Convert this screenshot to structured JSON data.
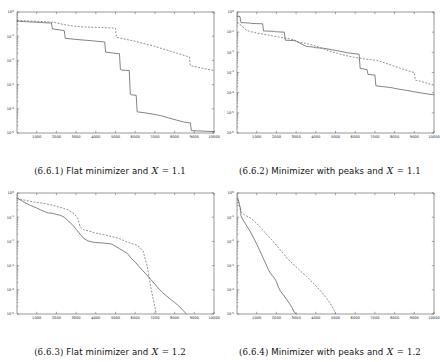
{
  "figure": {
    "panel_count": 4,
    "background_color": "#ffffff",
    "solid_series_color": "#5a5a5a",
    "dashed_series_color": "#6a6a6a",
    "axis_color": "#555555"
  },
  "panels": [
    {
      "id": "6.6.1",
      "caption_number": "(6.6.1)",
      "caption_text_before": "Flat minimizer and",
      "caption_variable": "X",
      "caption_equals": "= 1.1",
      "caption_full": "(6.6.1) Flat minimizer and X = 1.1"
    },
    {
      "id": "6.6.2",
      "caption_number": "(6.6.2)",
      "caption_text_before": "Minimizer with peaks and",
      "caption_variable": "X",
      "caption_equals": "= 1.1",
      "caption_full": "(6.6.2) Minimizer with peaks and X = 1.1"
    },
    {
      "id": "6.6.3",
      "caption_number": "(6.6.3)",
      "caption_text_before": "Flat minimizer and",
      "caption_variable": "X",
      "caption_equals": "= 1.2",
      "caption_full": "(6.6.3) Flat minimizer and X = 1.2"
    },
    {
      "id": "6.6.4",
      "caption_number": "(6.6.4)",
      "caption_text_before": "Minimizer with peaks and",
      "caption_variable": "X",
      "caption_equals": "= 1.2",
      "caption_full": "(6.6.4) Minimizer with peaks and X = 1.2"
    }
  ],
  "chart_data": [
    {
      "type": "line",
      "title": "(6.6.1) Flat minimizer and X = 1.1",
      "xlabel": "",
      "ylabel": "",
      "xlim": [
        0,
        10000
      ],
      "ylim": [
        1e-05,
        1
      ],
      "yscale": "log",
      "grid": false,
      "legend": null,
      "xticks": [
        1000,
        2000,
        3000,
        4000,
        5000,
        6000,
        7000,
        8000,
        9000,
        10000
      ],
      "xticklabels": [
        "1000",
        "2000",
        "3000",
        "4000",
        "5000",
        "6000",
        "7000",
        "8000",
        "9000",
        "10000"
      ],
      "yticks": [
        1,
        0.01,
        0.001,
        0.0001,
        1e-05
      ],
      "yticklabels": [
        "10^0",
        "10^-1",
        "10^-2",
        "10^-3",
        "10^-4",
        "10^-5"
      ],
      "series": [
        {
          "name": "solid",
          "style": "solid",
          "x": [
            0,
            400,
            900,
            1400,
            1750,
            1800,
            2200,
            2400,
            2450,
            2900,
            3300,
            3800,
            4200,
            4450,
            4500,
            4900,
            5200,
            5250,
            5300,
            5700,
            5750,
            5800,
            6050,
            6100,
            6500,
            6900,
            7300,
            7700,
            8100,
            8500,
            8800,
            8850,
            9200,
            9600,
            10000
          ],
          "y": [
            0.42,
            0.4,
            0.38,
            0.36,
            0.35,
            0.2,
            0.18,
            0.17,
            0.082,
            0.075,
            0.07,
            0.065,
            0.06,
            0.058,
            0.022,
            0.02,
            0.019,
            0.0042,
            0.004,
            0.0038,
            0.0004,
            0.00038,
            0.00036,
            7.5e-05,
            6.8e-05,
            6e-05,
            5.2e-05,
            4.2e-05,
            3.4e-05,
            2.8e-05,
            2.6e-05,
            1.25e-05,
            1.22e-05,
            1.18e-05,
            1.15e-05
          ]
        },
        {
          "name": "dashed",
          "style": "dashed",
          "x": [
            0,
            500,
            1100,
            1600,
            1900,
            2400,
            2900,
            3400,
            3900,
            4300,
            4400,
            4800,
            5000,
            5050,
            5500,
            6000,
            6500,
            7000,
            7400,
            7800,
            8200,
            8600,
            8750,
            8800,
            9200,
            9600,
            10000
          ],
          "y": [
            0.45,
            0.43,
            0.41,
            0.39,
            0.37,
            0.3,
            0.26,
            0.24,
            0.235,
            0.23,
            0.225,
            0.22,
            0.215,
            0.09,
            0.075,
            0.062,
            0.048,
            0.038,
            0.03,
            0.024,
            0.019,
            0.015,
            0.014,
            0.006,
            0.0052,
            0.0044,
            0.0038
          ]
        }
      ]
    },
    {
      "type": "line",
      "title": "(6.6.2) Minimizer with peaks and X = 1.1",
      "xlabel": "",
      "ylabel": "",
      "xlim": [
        0,
        10000
      ],
      "ylim": [
        1e-06,
        1
      ],
      "yscale": "log",
      "grid": false,
      "legend": null,
      "xticks": [
        1000,
        2000,
        3000,
        4000,
        5000,
        6000,
        7000,
        8000,
        9000,
        10000
      ],
      "xticklabels": [
        "1000",
        "2000",
        "3000",
        "4000",
        "5000",
        "6000",
        "7000",
        "8000",
        "9000",
        "10000"
      ],
      "yticks": [
        1,
        0.01,
        0.0001,
        1e-06
      ],
      "yticklabels": [
        "10^0",
        "10^-1",
        "10^-2",
        "10^-3",
        "10^-4",
        "10^-5"
      ],
      "series": [
        {
          "name": "solid",
          "style": "solid",
          "x": [
            0,
            150,
            200,
            700,
            750,
            1300,
            1350,
            1900,
            1950,
            2400,
            2450,
            2900,
            3000,
            3500,
            3900,
            4000,
            4400,
            4800,
            5200,
            5600,
            6000,
            6200,
            6250,
            6600,
            6650,
            7000,
            7050,
            7400,
            7800,
            8200,
            8600,
            9000,
            9400,
            9700,
            10000
          ],
          "y": [
            0.62,
            0.6,
            0.3,
            0.28,
            0.27,
            0.26,
            0.115,
            0.11,
            0.105,
            0.1,
            0.04,
            0.038,
            0.036,
            0.02,
            0.018,
            0.017,
            0.016,
            0.0135,
            0.0115,
            0.0095,
            0.0085,
            0.008,
            0.0016,
            0.0014,
            0.0008,
            0.00075,
            0.00022,
            0.0002,
            0.00018,
            0.00015,
            0.00013,
            0.00011,
            9.5e-05,
            8.5e-05,
            7.8e-05
          ]
        },
        {
          "name": "dashed",
          "style": "dashed",
          "x": [
            0,
            200,
            500,
            900,
            1300,
            1700,
            2100,
            2500,
            2900,
            3100,
            3500,
            3900,
            4300,
            4700,
            5100,
            5500,
            5900,
            6300,
            6700,
            7100,
            7500,
            7900,
            8300,
            8700,
            9000,
            9050,
            9400,
            9700,
            10000
          ],
          "y": [
            0.3,
            0.22,
            0.12,
            0.095,
            0.08,
            0.068,
            0.058,
            0.05,
            0.042,
            0.032,
            0.028,
            0.022,
            0.016,
            0.0115,
            0.0088,
            0.007,
            0.0058,
            0.005,
            0.0044,
            0.004,
            0.003,
            0.0022,
            0.0016,
            0.0012,
            0.001,
            0.00042,
            0.00035,
            0.00028,
            0.00024
          ]
        }
      ]
    },
    {
      "type": "line",
      "title": "(6.6.3) Flat minimizer and X = 1.2",
      "xlabel": "",
      "ylabel": "",
      "xlim": [
        0,
        10000
      ],
      "ylim": [
        1e-05,
        1
      ],
      "yscale": "log",
      "grid": false,
      "legend": null,
      "xticks": [
        1000,
        2000,
        3000,
        4000,
        5000,
        6000,
        7000,
        8000,
        9000,
        10000
      ],
      "xticklabels": [
        "1000",
        "2000",
        "3000",
        "4000",
        "5000",
        "6000",
        "7000",
        "8000",
        "9000",
        "10000"
      ],
      "yticks": [
        1,
        0.01,
        0.001,
        0.0001,
        1e-05
      ],
      "yticklabels": [
        "10^0",
        "10^-1",
        "10^-2",
        "10^-3",
        "10^-4",
        "10^-5"
      ],
      "series": [
        {
          "name": "solid",
          "style": "solid",
          "x": [
            0,
            200,
            400,
            700,
            1000,
            1200,
            1400,
            1600,
            1800,
            2000,
            2200,
            2400,
            2600,
            2800,
            3000,
            3200,
            3400,
            3600,
            3800,
            4000,
            4400,
            4800,
            5200,
            5600,
            5800,
            6000,
            6200,
            6400,
            6600,
            6800,
            7000,
            7200,
            7400,
            7600,
            7800,
            8000,
            8200,
            8400,
            8600
          ],
          "y": [
            0.6,
            0.5,
            0.4,
            0.3,
            0.24,
            0.2,
            0.17,
            0.15,
            0.145,
            0.13,
            0.12,
            0.1,
            0.07,
            0.05,
            0.032,
            0.02,
            0.013,
            0.0105,
            0.0095,
            0.009,
            0.0085,
            0.0078,
            0.005,
            0.0032,
            0.002,
            0.0014,
            0.0009,
            0.0006,
            0.0004,
            0.00026,
            0.00017,
            0.00011,
            7.5e-05,
            5.5e-05,
            4e-05,
            3e-05,
            2.2e-05,
            1.5e-05,
            1e-05
          ]
        },
        {
          "name": "dashed",
          "style": "dashed",
          "x": [
            0,
            200,
            500,
            900,
            1300,
            1700,
            2000,
            2300,
            2600,
            2900,
            3100,
            3200,
            3400,
            3700,
            4000,
            4400,
            4800,
            5200,
            5400,
            5600,
            5800,
            6000,
            6200,
            6400,
            6600,
            6700,
            6800,
            6900,
            7000,
            7050,
            7100
          ],
          "y": [
            0.62,
            0.55,
            0.48,
            0.42,
            0.38,
            0.33,
            0.28,
            0.24,
            0.2,
            0.14,
            0.085,
            0.04,
            0.03,
            0.026,
            0.022,
            0.019,
            0.016,
            0.013,
            0.011,
            0.0095,
            0.0082,
            0.0075,
            0.006,
            0.004,
            0.001,
            0.00035,
            0.00012,
            4.5e-05,
            2e-05,
            1.2e-05,
            1e-05
          ]
        }
      ]
    },
    {
      "type": "line",
      "title": "(6.6.4) Minimizer with peaks and X = 1.2",
      "xlabel": "",
      "ylabel": "",
      "xlim": [
        0,
        10000
      ],
      "ylim": [
        1e-05,
        1
      ],
      "yscale": "log",
      "grid": false,
      "legend": null,
      "xticks": [
        1000,
        2000,
        3000,
        4000,
        5000,
        6000,
        7000,
        8000,
        9000,
        10000
      ],
      "xticklabels": [
        "1000",
        "2000",
        "3000",
        "4000",
        "5000",
        "6000",
        "7000",
        "8000",
        "9000",
        "10000"
      ],
      "yticks": [
        1,
        0.01,
        0.001,
        0.0001,
        1e-05
      ],
      "yticklabels": [
        "10^0",
        "10^-1",
        "10^-2",
        "10^-3",
        "10^-4",
        "10^-5"
      ],
      "series": [
        {
          "name": "solid",
          "style": "solid",
          "x": [
            20,
            60,
            100,
            140,
            180,
            200,
            260,
            340,
            420,
            520,
            620,
            720,
            820,
            920,
            1020,
            1120,
            1220,
            1320,
            1420,
            1520,
            1600,
            1700,
            1800,
            1900,
            2000,
            2100,
            2200,
            2350,
            2500,
            2650,
            2800,
            2900,
            3000
          ],
          "y": [
            0.62,
            0.55,
            0.4,
            0.3,
            0.22,
            0.115,
            0.09,
            0.07,
            0.055,
            0.04,
            0.03,
            0.022,
            0.015,
            0.0105,
            0.0072,
            0.0048,
            0.0032,
            0.0021,
            0.0014,
            0.00095,
            0.00065,
            0.00048,
            0.00038,
            0.0003,
            0.00022,
            0.00013,
            9e-05,
            6.2e-05,
            4.2e-05,
            2.8e-05,
            1.8e-05,
            1.2e-05,
            1e-05
          ]
        },
        {
          "name": "dashed",
          "style": "dashed",
          "x": [
            20,
            100,
            200,
            300,
            420,
            560,
            700,
            850,
            1000,
            1150,
            1300,
            1450,
            1600,
            1750,
            1900,
            2050,
            2200,
            2350,
            2500,
            2700,
            2900,
            3100,
            3300,
            3500,
            3700,
            3900,
            4100,
            4300,
            4500,
            4700,
            4900,
            5000
          ],
          "y": [
            0.6,
            0.32,
            0.17,
            0.14,
            0.12,
            0.105,
            0.09,
            0.072,
            0.055,
            0.042,
            0.03,
            0.022,
            0.016,
            0.012,
            0.0085,
            0.0062,
            0.0044,
            0.0032,
            0.0022,
            0.0015,
            0.00105,
            0.00075,
            0.00052,
            0.00038,
            0.00026,
            0.00018,
            0.00012,
            8e-05,
            5e-05,
            3e-05,
            1.6e-05,
            1e-05
          ]
        }
      ]
    }
  ]
}
